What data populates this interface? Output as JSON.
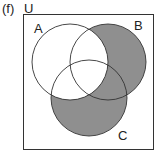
{
  "figure": {
    "part_label": "(f)",
    "universe_label": "U",
    "sets": [
      {
        "name": "A",
        "label": "A"
      },
      {
        "name": "B",
        "label": "B"
      },
      {
        "name": "C",
        "label": "C"
      }
    ],
    "shaded_region": "(B ∪ C) ∩ A'",
    "colors": {
      "shade": "#8f8f8f",
      "stroke": "#333333",
      "background": "#ffffff"
    }
  }
}
